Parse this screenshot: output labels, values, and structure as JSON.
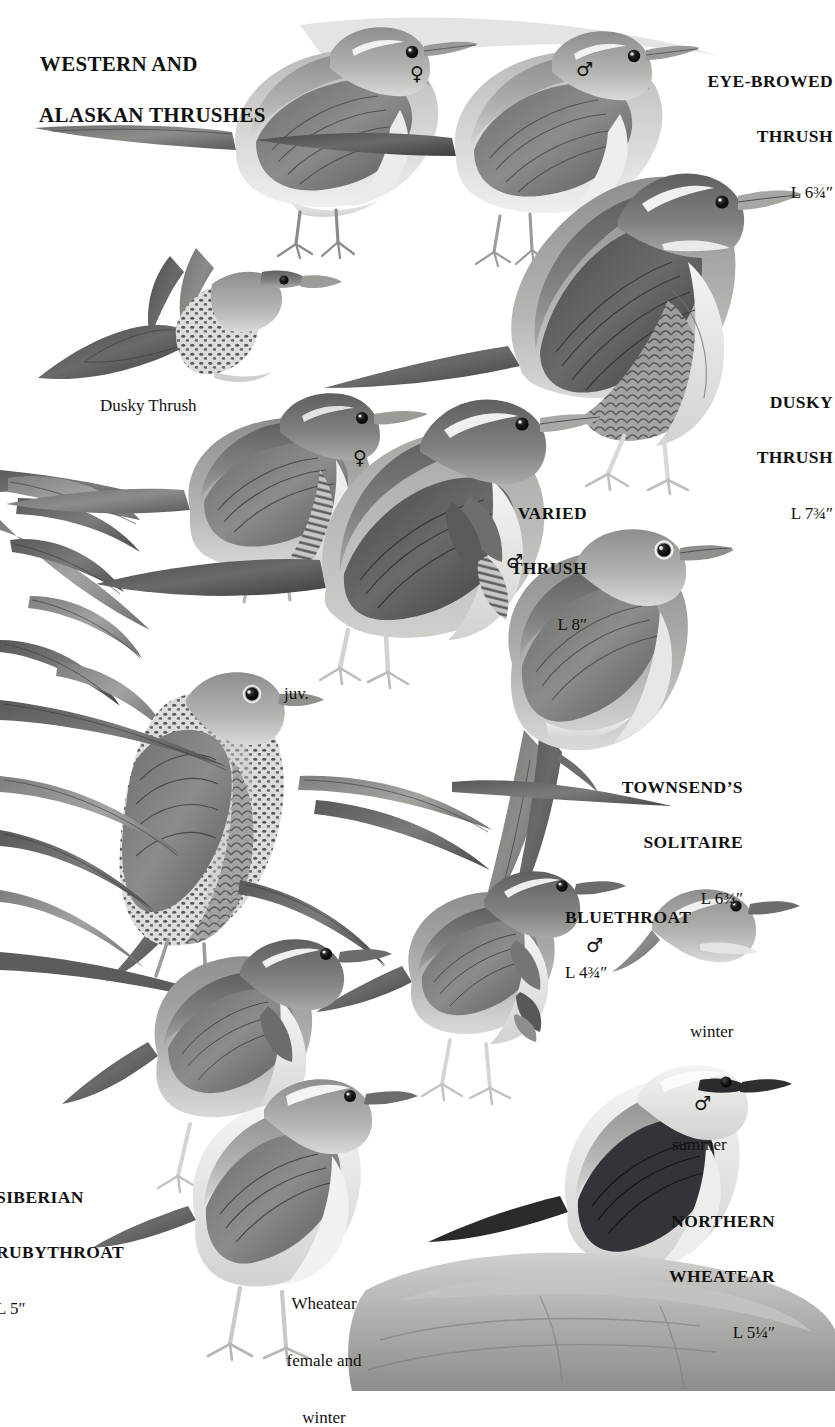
{
  "page": {
    "title_line1": "WESTERN AND",
    "title_line2": "ALASKAN THRUSHES",
    "background": "#ffffff",
    "ink": "#111111"
  },
  "species": [
    {
      "id": "eye-browed-thrush",
      "name_line1": "EYE-BROWED",
      "name_line2": "THRUSH",
      "length": "L 6¾″",
      "align": "right",
      "x": 648,
      "y": 36,
      "w": 185
    },
    {
      "id": "dusky-thrush",
      "name_line1": "DUSKY",
      "name_line2": "THRUSH",
      "length": "L 7¾″",
      "align": "right",
      "x": 648,
      "y": 357,
      "w": 185
    },
    {
      "id": "varied-thrush",
      "name_line1": "VARIED",
      "name_line2": "THRUSH",
      "length": "L 8″",
      "align": "right",
      "x": 462,
      "y": 468,
      "w": 125
    },
    {
      "id": "townsends-solitaire",
      "name_line1": "TOWNSEND’S",
      "name_line2": "SOLITAIRE",
      "length": "L 6¾″",
      "align": "right",
      "x": 558,
      "y": 742,
      "w": 185
    },
    {
      "id": "bluethroat",
      "name_line1": "BLUETHROAT",
      "name_line2": "",
      "length": "L 4¾″",
      "align": "left",
      "x": 565,
      "y": 872,
      "w": 200
    },
    {
      "id": "siberian-rubythroat",
      "name_line1": "SIBERIAN",
      "name_line2": "RUBYTHROAT",
      "length": "L 5″",
      "align": "left",
      "x": -4,
      "y": 1152,
      "w": 160
    },
    {
      "id": "northern-wheatear",
      "name_line1": "NORTHERN",
      "name_line2": "WHEATEAR",
      "length": "L 5¼″",
      "align": "right",
      "x": 620,
      "y": 1176,
      "w": 155
    }
  ],
  "captions": [
    {
      "id": "dusky-thrush-flight",
      "text": "Dusky Thrush",
      "x": 100,
      "y": 396,
      "align": "left"
    },
    {
      "id": "varied-thrush-juvenile",
      "text": "juv.",
      "x": 284,
      "y": 684,
      "align": "left"
    },
    {
      "id": "wheatear-winter",
      "text": "winter",
      "x": 690,
      "y": 1022,
      "align": "left"
    },
    {
      "id": "wheatear-summer",
      "text": "summer",
      "x": 672,
      "y": 1135,
      "align": "left"
    },
    {
      "id": "wheatear-female-winter-line1",
      "text": "Wheatear",
      "x": 268,
      "y": 1256,
      "align": "center",
      "w": 110
    },
    {
      "id": "wheatear-female-winter-line2",
      "text": "female and",
      "x": 268,
      "y": 1281,
      "align": "center",
      "w": 110
    },
    {
      "id": "wheatear-female-winter-line3",
      "text": "winter",
      "x": 268,
      "y": 1306,
      "align": "center",
      "w": 110
    }
  ],
  "sex_symbols": [
    {
      "id": "eye-browed-thrush-female",
      "glyph": "♀",
      "x": 410,
      "y": 64
    },
    {
      "id": "eye-browed-thrush-male",
      "glyph": "♂",
      "x": 576,
      "y": 60
    },
    {
      "id": "varied-thrush-female",
      "glyph": "♀",
      "x": 353,
      "y": 448
    },
    {
      "id": "varied-thrush-male",
      "glyph": "♂",
      "x": 506,
      "y": 552
    },
    {
      "id": "bluethroat-male",
      "glyph": "♂",
      "x": 586,
      "y": 936
    },
    {
      "id": "northern-wheatear-male",
      "glyph": "♂",
      "x": 694,
      "y": 1094
    }
  ]
}
